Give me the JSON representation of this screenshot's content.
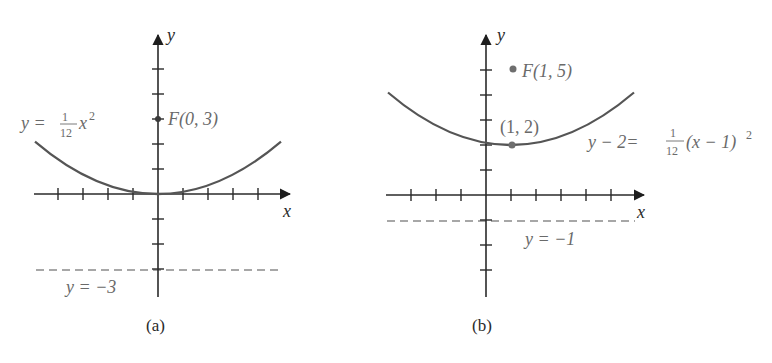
{
  "figures": [
    {
      "id": "a",
      "caption": "(a)",
      "x_axis_label": "x",
      "y_axis_label": "y",
      "equation": {
        "lhs": "y = ",
        "frac_num": "1",
        "frac_den": "12",
        "rhs": "x",
        "exp": "2"
      },
      "focus_label": "F(0, 3)",
      "directrix_label": "y = −3",
      "focus": [
        0,
        3
      ],
      "vertex": [
        0,
        0
      ],
      "directrix_y": -3
    },
    {
      "id": "b",
      "caption": "(b)",
      "x_axis_label": "x",
      "y_axis_label": "y",
      "equation": {
        "lhs": "y − 2= ",
        "frac_num": "1",
        "frac_den": "12",
        "rhs": "(x − 1)",
        "exp": "2"
      },
      "focus_label": "F(1, 5)",
      "vertex_label": "(1, 2)",
      "directrix_label": "y = −1",
      "focus": [
        1,
        5
      ],
      "vertex": [
        1,
        2
      ],
      "directrix_y": -1
    }
  ],
  "colors": {
    "axis": "#2a2a2a",
    "curve": "#555555",
    "dashed": "#8a8a8a",
    "point": "#6e6e6e",
    "text": "#6a6a6a"
  }
}
